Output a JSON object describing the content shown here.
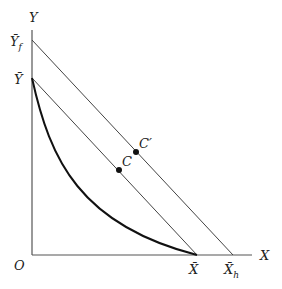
{
  "diagram": {
    "type": "economics-ppf-budget-lines",
    "axes": {
      "x_label": "X",
      "y_label": "Y",
      "origin_label": "O"
    },
    "y_intercepts": [
      {
        "id": "Y_bar",
        "label": "Ȳ",
        "subscript": ""
      },
      {
        "id": "Y_bar_f",
        "label": "Ȳ",
        "subscript": "f"
      }
    ],
    "x_intercepts": [
      {
        "id": "X_bar",
        "label": "X̄",
        "subscript": ""
      },
      {
        "id": "X_bar_h",
        "label": "X̄",
        "subscript": "h"
      }
    ],
    "points": [
      {
        "id": "C",
        "label": "C"
      },
      {
        "id": "C_prime",
        "label": "C′"
      }
    ],
    "curves": [
      {
        "id": "ppf",
        "description": "convex curve from Ȳ to X̄"
      },
      {
        "id": "line-inner",
        "description": "straight line from Ȳ to X̄"
      },
      {
        "id": "line-outer",
        "description": "straight line from Ȳ_f to X̄_h"
      }
    ]
  }
}
